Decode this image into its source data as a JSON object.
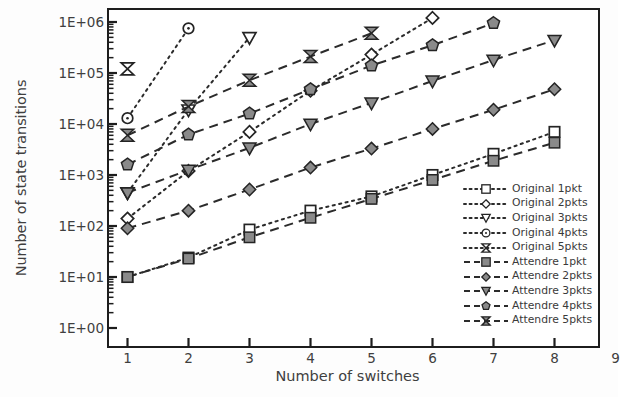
{
  "chart_data": {
    "type": "line",
    "title": "",
    "xlabel": "Number of switches",
    "ylabel": "Number of state transitions",
    "xlim": [
      0.4,
      9.0
    ],
    "ylim": [
      1,
      1000000
    ],
    "yscale": "log",
    "grid": false,
    "legend_position": "inside-right",
    "x_ticks": [
      "1",
      "2",
      "3",
      "4",
      "5",
      "6",
      "7",
      "8",
      "9"
    ],
    "y_ticks": [
      "1E+00",
      "1E+01",
      "1E+02",
      "1E+03",
      "1E+04",
      "1E+05",
      "1E+06"
    ],
    "series": [
      {
        "name": "Original 1pkt",
        "marker": "square-open",
        "linestyle": "dotted",
        "x": [
          1,
          2,
          3,
          4,
          5,
          6,
          7,
          8
        ],
        "values": [
          10,
          24,
          85,
          200,
          380,
          1000,
          2600,
          7000
        ]
      },
      {
        "name": "Original 2pkts",
        "marker": "diamond-open",
        "linestyle": "dotted",
        "x": [
          1,
          2,
          3,
          4,
          5,
          6
        ],
        "values": [
          140,
          1200,
          7000,
          45000,
          230000,
          1200000
        ]
      },
      {
        "name": "Original 3pkts",
        "marker": "triangle-down-open",
        "linestyle": "dotted",
        "x": [
          1,
          2,
          3
        ],
        "values": [
          450,
          19000,
          500000
        ]
      },
      {
        "name": "Original 4pkts",
        "marker": "circle-open",
        "linestyle": "dotted",
        "x": [
          1,
          2
        ],
        "values": [
          13000,
          750000
        ]
      },
      {
        "name": "Original 5pkts",
        "marker": "bowtie-open",
        "linestyle": "dotted",
        "x": [
          1
        ],
        "values": [
          120000
        ]
      },
      {
        "name": "Attendre 1pkt",
        "marker": "square-filled",
        "linestyle": "dashed",
        "x": [
          1,
          2,
          3,
          4,
          5,
          6,
          7,
          8
        ],
        "values": [
          10,
          23,
          60,
          145,
          340,
          800,
          1900,
          4300
        ]
      },
      {
        "name": "Attendre 2pkts",
        "marker": "diamond-filled",
        "linestyle": "dashed",
        "x": [
          1,
          2,
          3,
          4,
          5,
          6,
          7,
          8
        ],
        "values": [
          90,
          200,
          520,
          1400,
          3300,
          8000,
          19000,
          48000
        ]
      },
      {
        "name": "Attendre 3pkts",
        "marker": "triangle-down-filled",
        "linestyle": "dashed",
        "x": [
          1,
          2,
          3,
          4,
          5,
          6,
          7,
          8
        ],
        "values": [
          450,
          1250,
          3400,
          10000,
          26000,
          70000,
          180000,
          440000
        ]
      },
      {
        "name": "Attendre 4pkts",
        "marker": "pentagon-filled",
        "linestyle": "dashed",
        "x": [
          1,
          2,
          3,
          4,
          5,
          6,
          7
        ],
        "values": [
          1600,
          6200,
          16000,
          48000,
          140000,
          350000,
          950000
        ]
      },
      {
        "name": "Attendre 5pkts",
        "marker": "bowtie-filled",
        "linestyle": "dashed",
        "x": [
          1,
          2,
          3,
          4,
          5
        ],
        "values": [
          6000,
          22000,
          72000,
          210000,
          600000
        ]
      }
    ]
  },
  "legend": {
    "items": [
      {
        "label": "Original 1pkt",
        "marker": "square-open",
        "style": "dotted"
      },
      {
        "label": "Original 2pkts",
        "marker": "diamond-open",
        "style": "dotted"
      },
      {
        "label": "Original 3pkts",
        "marker": "triangle-down-open",
        "style": "dotted"
      },
      {
        "label": "Original 4pkts",
        "marker": "circle-open",
        "style": "dotted"
      },
      {
        "label": "Original 5pkts",
        "marker": "bowtie-open",
        "style": "dotted"
      },
      {
        "label": "Attendre 1pkt",
        "marker": "square-filled",
        "style": "dashed"
      },
      {
        "label": "Attendre 2pkts",
        "marker": "diamond-filled",
        "style": "dashed"
      },
      {
        "label": "Attendre 3pkts",
        "marker": "triangle-down-filled",
        "style": "dashed"
      },
      {
        "label": "Attendre 4pkts",
        "marker": "pentagon-filled",
        "style": "dashed"
      },
      {
        "label": "Attendre 5pkts",
        "marker": "bowtie-filled",
        "style": "dashed"
      }
    ]
  },
  "colors": {
    "line": "#2b2b2b",
    "marker_fill": "#8a8a8a",
    "marker_edge": "#242424",
    "axis": "#1d1d1d",
    "text": "#3f3f3f",
    "background": "#ffffff"
  }
}
